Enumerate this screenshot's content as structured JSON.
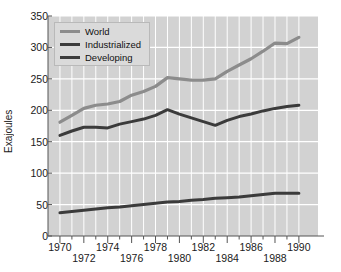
{
  "chart_data": {
    "type": "line",
    "title": "",
    "xlabel": "",
    "ylabel": "Exajoules",
    "xlim": [
      1969,
      1991.6
    ],
    "ylim": [
      0,
      350
    ],
    "grid": true,
    "legend_position": "top-left",
    "background": "#d2d2d2",
    "gridline_color": "#ffffff",
    "x": [
      1970,
      1971,
      1972,
      1973,
      1974,
      1975,
      1976,
      1977,
      1978,
      1979,
      1980,
      1981,
      1982,
      1983,
      1984,
      1985,
      1986,
      1987,
      1988,
      1989,
      1990
    ],
    "xticks_major": [
      1970,
      1972,
      1974,
      1976,
      1978,
      1980,
      1982,
      1984,
      1986,
      1988,
      1990
    ],
    "xticklabels_row1": [
      "1970",
      "1974",
      "1978",
      "1982",
      "1986",
      "1990"
    ],
    "xticklabels_row2": [
      "1972",
      "1976",
      "1980",
      "1984",
      "1988"
    ],
    "yticks": [
      0,
      50,
      100,
      150,
      200,
      250,
      300,
      350
    ],
    "yticklabels": [
      "0",
      "50",
      "100",
      "150",
      "200",
      "250",
      "300",
      "350"
    ],
    "series": [
      {
        "name": "World",
        "color": "#8c8c8c",
        "width": 3.2,
        "values": [
          181,
          192,
          203,
          208,
          210,
          214,
          224,
          230,
          238,
          252,
          250,
          248,
          248,
          250,
          262,
          272,
          282,
          294,
          307,
          306,
          316
        ]
      },
      {
        "name": "Industrialized",
        "color": "#3b3b3b",
        "width": 3.0,
        "values": [
          160,
          167,
          173,
          173,
          172,
          178,
          182,
          186,
          192,
          201,
          194,
          188,
          182,
          176,
          184,
          190,
          194,
          199,
          203,
          206,
          208
        ]
      },
      {
        "name": "Developing",
        "color": "#3b3b3b",
        "width": 3.0,
        "values": [
          37,
          39,
          41,
          43,
          45,
          46,
          48,
          50,
          52,
          54,
          55,
          57,
          58,
          60,
          61,
          62,
          64,
          66,
          68,
          68,
          68
        ]
      }
    ]
  },
  "legend": {
    "items": [
      {
        "label": "World",
        "color": "#8c8c8c"
      },
      {
        "label": "Industrialized",
        "color": "#3b3b3b"
      },
      {
        "label": "Developing",
        "color": "#3b3b3b"
      }
    ]
  },
  "axes": {
    "ylabel": "Exajoules"
  }
}
